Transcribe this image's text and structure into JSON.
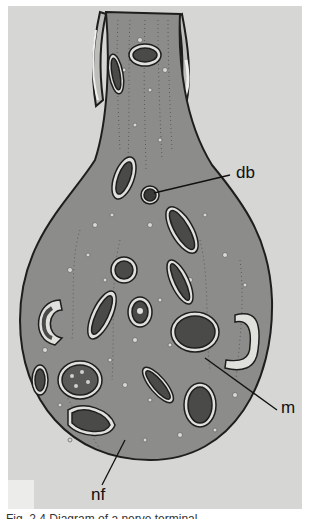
{
  "figure": {
    "type": "illustration",
    "labels": [
      {
        "id": "db",
        "text": "db",
        "x": 236,
        "y": 162
      },
      {
        "id": "m",
        "text": "m",
        "x": 281,
        "y": 397
      },
      {
        "id": "nf",
        "text": "nf",
        "x": 91,
        "y": 467
      }
    ],
    "caption": "Fig. 2.4  Diagram of a nerve terminal...",
    "colors": {
      "background": "#d6d6d4",
      "cytoplasm": "#8c8c8a",
      "outline": "#1e1e1e",
      "organelle_dark": "#4a4a48",
      "organelle_light": "#e0e0dc"
    }
  }
}
